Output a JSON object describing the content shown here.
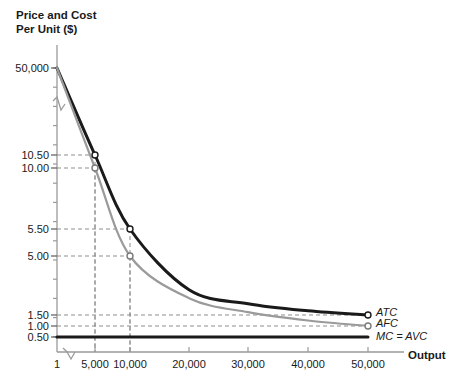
{
  "chart_data": {
    "type": "line",
    "title": "Price and Cost Per Unit ($)",
    "ylabel": "Price and Cost\nPer Unit ($)",
    "xlabel": "Output",
    "grid": "dashed-guides",
    "legend_position": "right-inline",
    "axis_break_x": true,
    "axis_break_y": true,
    "xticks": [
      {
        "label": "1",
        "value": 1
      },
      {
        "label": "5,000",
        "value": 5000
      },
      {
        "label": "10,000",
        "value": 10000
      },
      {
        "label": "20,000",
        "value": 20000
      },
      {
        "label": "30,000",
        "value": 30000
      },
      {
        "label": "40,000",
        "value": 40000
      },
      {
        "label": "50,000",
        "value": 50000
      }
    ],
    "yticks": [
      {
        "label": "50,000",
        "value": 50000
      },
      {
        "label": "10.50",
        "value": 10.5
      },
      {
        "label": "10.00",
        "value": 10.0
      },
      {
        "label": "5.50",
        "value": 5.5
      },
      {
        "label": "5.00",
        "value": 5.0
      },
      {
        "label": "1.50",
        "value": 1.5
      },
      {
        "label": "1.00",
        "value": 1.0
      },
      {
        "label": "0.50",
        "value": 0.5
      }
    ],
    "series": [
      {
        "name": "ATC",
        "label": "ATC",
        "color": "#1a1a1a",
        "points": [
          {
            "x": 1,
            "y": 50000
          },
          {
            "x": 5000,
            "y": 10.5
          },
          {
            "x": 10000,
            "y": 5.5
          },
          {
            "x": 20000,
            "y": 3.0
          },
          {
            "x": 30000,
            "y": 2.17
          },
          {
            "x": 40000,
            "y": 1.75
          },
          {
            "x": 50000,
            "y": 1.5
          }
        ]
      },
      {
        "name": "AFC",
        "label": "AFC",
        "color": "#9a9a9a",
        "points": [
          {
            "x": 1,
            "y": 50000
          },
          {
            "x": 5000,
            "y": 10.0
          },
          {
            "x": 10000,
            "y": 5.0
          },
          {
            "x": 20000,
            "y": 2.5
          },
          {
            "x": 30000,
            "y": 1.67
          },
          {
            "x": 40000,
            "y": 1.25
          },
          {
            "x": 50000,
            "y": 1.0
          }
        ]
      },
      {
        "name": "MC = AVC",
        "label": "MC = AVC",
        "color": "#1a1a1a",
        "points": [
          {
            "x": 1,
            "y": 0.5
          },
          {
            "x": 50000,
            "y": 0.5
          }
        ]
      }
    ],
    "markers": [
      {
        "series": "ATC",
        "x": 5000,
        "y": 10.5
      },
      {
        "series": "AFC",
        "x": 5000,
        "y": 10.0
      },
      {
        "series": "ATC",
        "x": 10000,
        "y": 5.5
      },
      {
        "series": "AFC",
        "x": 10000,
        "y": 5.0
      },
      {
        "series": "ATC",
        "x": 50000,
        "y": 1.5
      },
      {
        "series": "AFC",
        "x": 50000,
        "y": 1.0
      }
    ]
  }
}
